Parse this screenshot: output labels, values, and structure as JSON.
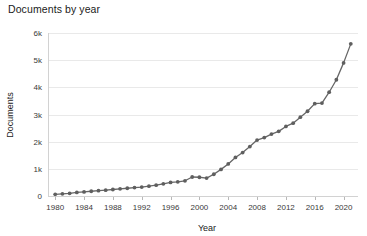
{
  "chart_data": {
    "type": "line",
    "title": "Documents by year",
    "xlabel": "Year",
    "ylabel": "Documents",
    "grid": true,
    "legend": "none",
    "xlim": [
      1979,
      2022
    ],
    "ylim": [
      0,
      6000
    ],
    "x_ticks": [
      1980,
      1984,
      1988,
      1992,
      1996,
      2000,
      2004,
      2008,
      2012,
      2016,
      2020
    ],
    "x_tick_labels": [
      "1980",
      "1984",
      "1988",
      "1992",
      "1996",
      "2000",
      "2004",
      "2008",
      "2012",
      "2016",
      "2020"
    ],
    "y_ticks": [
      0,
      1000,
      2000,
      3000,
      4000,
      5000,
      6000
    ],
    "y_tick_labels": [
      "0",
      "1k",
      "2k",
      "3k",
      "4k",
      "5k",
      "6k"
    ],
    "line_color": "#666666",
    "marker_color": "#5f5f5f",
    "grid_color": "#e9e9e9",
    "x": [
      1980,
      1981,
      1982,
      1983,
      1984,
      1985,
      1986,
      1987,
      1988,
      1989,
      1990,
      1991,
      1992,
      1993,
      1994,
      1995,
      1996,
      1997,
      1998,
      1999,
      2000,
      2001,
      2002,
      2003,
      2004,
      2005,
      2006,
      2007,
      2008,
      2009,
      2010,
      2011,
      2012,
      2013,
      2014,
      2015,
      2016,
      2017,
      2018,
      2019,
      2020,
      2021
    ],
    "values": [
      60,
      80,
      100,
      130,
      150,
      175,
      195,
      215,
      240,
      265,
      285,
      310,
      330,
      360,
      400,
      450,
      500,
      520,
      560,
      700,
      690,
      660,
      800,
      980,
      1180,
      1420,
      1600,
      1820,
      2060,
      2150,
      2280,
      2380,
      2560,
      2680,
      2900,
      3120,
      3400,
      3420,
      3820,
      4280,
      4900,
      5600
    ],
    "series": [
      {
        "name": "Documents",
        "values": [
          60,
          80,
          100,
          130,
          150,
          175,
          195,
          215,
          240,
          265,
          285,
          310,
          330,
          360,
          400,
          450,
          500,
          520,
          560,
          700,
          690,
          660,
          800,
          980,
          1180,
          1420,
          1600,
          1820,
          2060,
          2150,
          2280,
          2380,
          2560,
          2680,
          2900,
          3120,
          3400,
          3420,
          3820,
          4280,
          4900,
          5600
        ]
      }
    ]
  }
}
